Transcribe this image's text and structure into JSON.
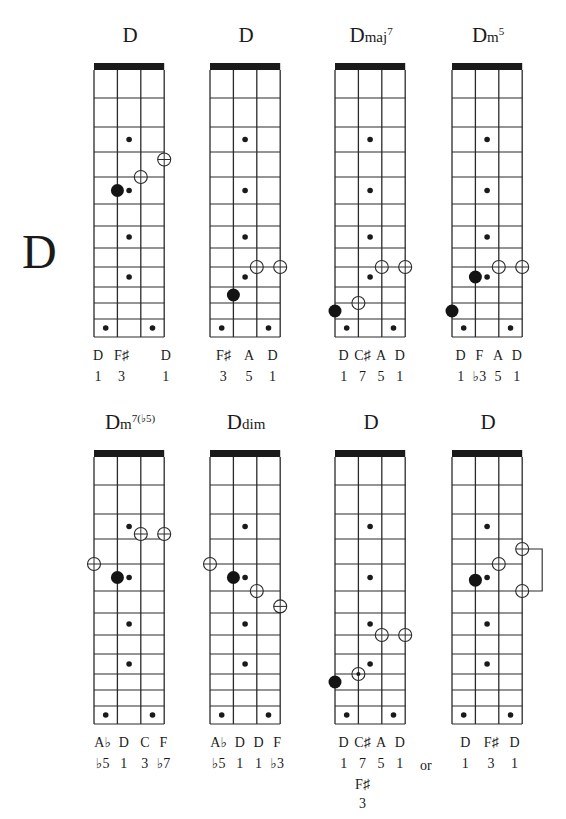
{
  "page": {
    "key_letter": "D",
    "or_text": "or"
  },
  "fretboard": {
    "strings": 4,
    "fret_cells": 12,
    "inlay_frets": [
      3,
      5,
      7,
      9
    ],
    "double_inlay_fret": 12
  },
  "chords": [
    {
      "root": "D",
      "suffix": "",
      "sup": "",
      "open_circles": [
        {
          "string": 2,
          "fret_line": 4
        },
        {
          "string": 3,
          "fret_line": 3.3
        }
      ],
      "filled_dots": [
        {
          "string": 1,
          "fret_line": 4.5
        }
      ],
      "notes": [
        "D",
        "F♯",
        "D"
      ],
      "degrees": [
        "1",
        "3",
        "1"
      ],
      "label_strings": [
        0,
        1,
        2.9
      ]
    },
    {
      "root": "D",
      "suffix": "",
      "sup": "",
      "open_circles": [
        {
          "string": 2,
          "fret_line": 8
        },
        {
          "string": 3,
          "fret_line": 8
        }
      ],
      "filled_dots": [
        {
          "string": 1,
          "fret_line": 9.5
        }
      ],
      "notes": [
        "F♯",
        "A",
        "D"
      ],
      "degrees": [
        "3",
        "5",
        "1"
      ],
      "label_strings": [
        0.4,
        1.5,
        2.5
      ]
    },
    {
      "root": "D",
      "suffix": "maj",
      "sup": "7",
      "open_circles": [
        {
          "string": 2,
          "fret_line": 8
        },
        {
          "string": 3,
          "fret_line": 8
        },
        {
          "string": 1,
          "fret_line": 10
        }
      ],
      "filled_dots": [
        {
          "string": 0,
          "fret_line": 10.5
        }
      ],
      "notes": [
        "D",
        "C♯",
        "A",
        "D"
      ],
      "degrees": [
        "1",
        "7",
        "5",
        "1"
      ],
      "label_strings": [
        0.2,
        1,
        1.8,
        2.6
      ]
    },
    {
      "root": "D",
      "suffix": "m",
      "sup": "5",
      "open_circles": [
        {
          "string": 2,
          "fret_line": 8
        },
        {
          "string": 3,
          "fret_line": 8
        }
      ],
      "filled_dots": [
        {
          "string": 1,
          "fret_line": 8.5
        },
        {
          "string": 0,
          "fret_line": 10.5
        }
      ],
      "notes": [
        "D",
        "F",
        "A",
        "D"
      ],
      "degrees": [
        "1",
        "♭3",
        "5",
        "1"
      ],
      "label_strings": [
        0.2,
        1,
        1.8,
        2.6
      ]
    },
    {
      "root": "D",
      "suffix": "m",
      "sup": "7(♭5)",
      "open_circles": [
        {
          "string": 2,
          "fret_line": 2.8
        },
        {
          "string": 3,
          "fret_line": 2.8
        },
        {
          "string": 0,
          "fret_line": 4
        }
      ],
      "filled_dots": [
        {
          "string": 1,
          "fret_line": 4.5
        }
      ],
      "notes": [
        "A♭",
        "D",
        "C",
        "F"
      ],
      "degrees": [
        "♭5",
        "1",
        "3",
        "♭7"
      ],
      "label_strings": [
        0.2,
        1.1,
        2,
        2.8
      ]
    },
    {
      "root": "D",
      "suffix": "dim",
      "sup": "",
      "open_circles": [
        {
          "string": 0,
          "fret_line": 4
        },
        {
          "string": 2,
          "fret_line": 5
        },
        {
          "string": 3,
          "fret_line": 5.7
        }
      ],
      "filled_dots": [
        {
          "string": 1,
          "fret_line": 4.5
        }
      ],
      "notes": [
        "A♭",
        "D",
        "D",
        "F"
      ],
      "degrees": [
        "♭5",
        "1",
        "1",
        "♭3"
      ],
      "label_strings": [
        0.2,
        1.1,
        1.9,
        2.7
      ]
    },
    {
      "root": "D",
      "suffix": "",
      "sup": "",
      "open_circles": [
        {
          "string": 2,
          "fret_line": 7
        },
        {
          "string": 3,
          "fret_line": 7
        },
        {
          "string": 1,
          "fret_line": 9,
          "dotted": true
        }
      ],
      "filled_dots": [
        {
          "string": 0,
          "fret_line": 9.5
        }
      ],
      "notes": [
        "D",
        "C♯",
        "A",
        "D"
      ],
      "degrees": [
        "1",
        "7",
        "5",
        "1"
      ],
      "extra_note": "F♯",
      "extra_degree": "3",
      "label_strings": [
        0.2,
        1,
        1.8,
        2.6
      ]
    },
    {
      "root": "D",
      "suffix": "",
      "sup": "",
      "open_circles": [
        {
          "string": 3,
          "fret_line": 3.4
        },
        {
          "string": 2,
          "fret_line": 4
        },
        {
          "string": 3,
          "fret_line": 5
        }
      ],
      "filled_dots": [
        {
          "string": 1,
          "fret_line": 4.6
        }
      ],
      "bracket": [
        3.4,
        5
      ],
      "notes": [
        "D",
        "F♯",
        "D"
      ],
      "degrees": [
        "1",
        "3",
        "1"
      ],
      "label_strings": [
        0.4,
        1.5,
        2.5
      ]
    }
  ]
}
